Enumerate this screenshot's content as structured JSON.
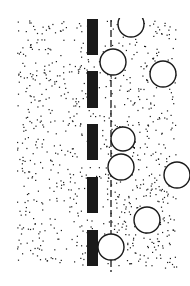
{
  "figure": {
    "width": 190,
    "height": 286,
    "background": "#ffffff",
    "ink": "#1a1a1a",
    "stipple_region": {
      "x0": 17,
      "y0": 20,
      "x1": 176,
      "y1": 268,
      "count": 900,
      "seed": 7
    },
    "barrier_bars": [
      {
        "x": 87,
        "y": 19,
        "w": 11,
        "h": 36
      },
      {
        "x": 87,
        "y": 71,
        "w": 11,
        "h": 37
      },
      {
        "x": 87,
        "y": 124,
        "w": 11,
        "h": 36
      },
      {
        "x": 87,
        "y": 177,
        "w": 11,
        "h": 36
      },
      {
        "x": 87,
        "y": 230,
        "w": 11,
        "h": 36
      }
    ],
    "dashed_line": {
      "x": 111,
      "y1": 20,
      "y2": 272,
      "dash": "7,3"
    },
    "circles": [
      {
        "cx": 131,
        "cy": 24,
        "r": 13
      },
      {
        "cx": 113,
        "cy": 62,
        "r": 13
      },
      {
        "cx": 163,
        "cy": 74,
        "r": 13
      },
      {
        "cx": 123,
        "cy": 139,
        "r": 12
      },
      {
        "cx": 121,
        "cy": 167,
        "r": 13
      },
      {
        "cx": 177,
        "cy": 175,
        "r": 13
      },
      {
        "cx": 147,
        "cy": 220,
        "r": 13
      },
      {
        "cx": 111,
        "cy": 247,
        "r": 13
      }
    ],
    "clip_top": 18
  }
}
